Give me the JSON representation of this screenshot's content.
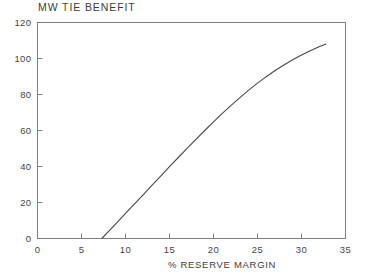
{
  "chart_data": {
    "type": "line",
    "title": "MW TIE BENEFIT",
    "xlabel": "% RESERVE MARGIN",
    "ylabel": "",
    "xlim": [
      0,
      35
    ],
    "ylim": [
      0,
      120
    ],
    "xticks": [
      0,
      5,
      10,
      15,
      20,
      25,
      30,
      35
    ],
    "xticklabels": [
      "0",
      "5",
      "10",
      "15",
      "20",
      "25",
      "30",
      "35"
    ],
    "yticks": [
      0,
      20,
      40,
      60,
      80,
      100,
      120
    ],
    "yticklabels": [
      "0",
      "20",
      "40",
      "60",
      "80",
      "100",
      "120"
    ],
    "grid": false,
    "legend": false,
    "line_color": "#4a4a4a",
    "frame_color": "#808080",
    "background_color": "#ffffff",
    "series": [
      {
        "name": "MW tie benefit",
        "x": [
          7.3,
          8,
          9,
          10,
          11,
          12,
          13,
          14,
          15,
          16,
          17,
          18,
          19,
          20,
          21,
          22,
          23,
          24,
          25,
          26,
          27,
          28,
          29,
          30,
          31,
          32,
          32.8
        ],
        "y": [
          0,
          3.6,
          8.7,
          13.9,
          19.1,
          24.3,
          29.5,
          34.7,
          39.9,
          45.0,
          50.1,
          55.1,
          60.0,
          64.8,
          69.5,
          74.0,
          78.3,
          82.4,
          86.3,
          89.9,
          93.3,
          96.4,
          99.3,
          101.9,
          104.3,
          106.5,
          108.0
        ]
      }
    ]
  }
}
